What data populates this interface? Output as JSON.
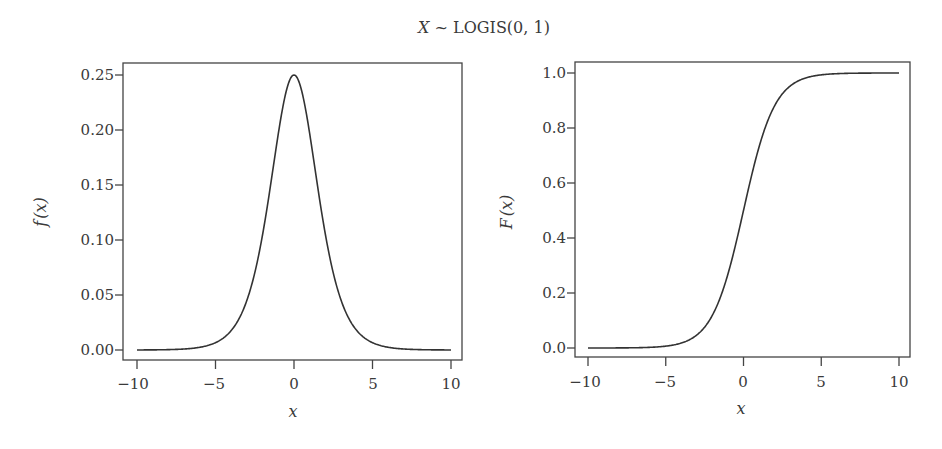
{
  "figure": {
    "title": "X ~ LOGIS(0, 1)",
    "title_parts": {
      "var": "X",
      "rest": " ~ LOGIS(0, 1)"
    }
  },
  "chart_data": [
    {
      "type": "line",
      "name": "pdf",
      "title": "X ~ LOGIS(0, 1)",
      "xlabel": "x",
      "ylabel": "f(x)",
      "xlim": [
        -10,
        10
      ],
      "ylim": [
        0,
        0.25
      ],
      "xticks": [
        -10,
        -5,
        0,
        5,
        10
      ],
      "xtick_labels": [
        "−10",
        "−5",
        "0",
        "5",
        "10"
      ],
      "yticks": [
        0,
        0.05,
        0.1,
        0.15,
        0.2,
        0.25
      ],
      "ytick_labels": [
        "0.00",
        "0.05",
        "0.10",
        "0.15",
        "0.20",
        "0.25"
      ],
      "grid": false,
      "legend": null,
      "x": [
        -10,
        -8,
        -6,
        -5,
        -4,
        -3,
        -2,
        -1.5,
        -1,
        -0.5,
        0,
        0.5,
        1,
        1.5,
        2,
        3,
        4,
        5,
        6,
        8,
        10
      ],
      "y": [
        0.0,
        0.0003,
        0.0025,
        0.0066,
        0.0177,
        0.0452,
        0.105,
        0.1491,
        0.1966,
        0.235,
        0.25,
        0.235,
        0.1966,
        0.1491,
        0.105,
        0.0452,
        0.0177,
        0.0066,
        0.0025,
        0.0003,
        0.0
      ]
    },
    {
      "type": "line",
      "name": "cdf",
      "xlabel": "x",
      "ylabel": "F(x)",
      "xlim": [
        -10,
        10
      ],
      "ylim": [
        0,
        1.0
      ],
      "xticks": [
        -10,
        -5,
        0,
        5,
        10
      ],
      "xtick_labels": [
        "−10",
        "−5",
        "0",
        "5",
        "10"
      ],
      "yticks": [
        0,
        0.2,
        0.4,
        0.6,
        0.8,
        1.0
      ],
      "ytick_labels": [
        "0.0",
        "0.2",
        "0.4",
        "0.6",
        "0.8",
        "1.0"
      ],
      "grid": false,
      "legend": null,
      "x": [
        -10,
        -8,
        -6,
        -5,
        -4,
        -3,
        -2,
        -1.5,
        -1,
        -0.5,
        0,
        0.5,
        1,
        1.5,
        2,
        3,
        4,
        5,
        6,
        8,
        10
      ],
      "y": [
        0.0,
        0.0003,
        0.0025,
        0.0067,
        0.018,
        0.0474,
        0.1192,
        0.1824,
        0.2689,
        0.3775,
        0.5,
        0.6225,
        0.7311,
        0.8176,
        0.8808,
        0.9526,
        0.982,
        0.9933,
        0.9975,
        0.9997,
        1.0
      ]
    }
  ],
  "panels": {
    "left": {
      "ylabel": {
        "f": "f",
        "paren": "(x)"
      },
      "xlabel": "x",
      "xtick_labels": [
        "−10",
        "−5",
        "0",
        "5",
        "10"
      ],
      "ytick_labels": [
        "0.00",
        "0.05",
        "0.10",
        "0.15",
        "0.20",
        "0.25"
      ]
    },
    "right": {
      "ylabel": {
        "f": "F",
        "paren": "(x)"
      },
      "xlabel": "x",
      "xtick_labels": [
        "−10",
        "−5",
        "0",
        "5",
        "10"
      ],
      "ytick_labels": [
        "0.0",
        "0.2",
        "0.4",
        "0.6",
        "0.8",
        "1.0"
      ]
    }
  }
}
